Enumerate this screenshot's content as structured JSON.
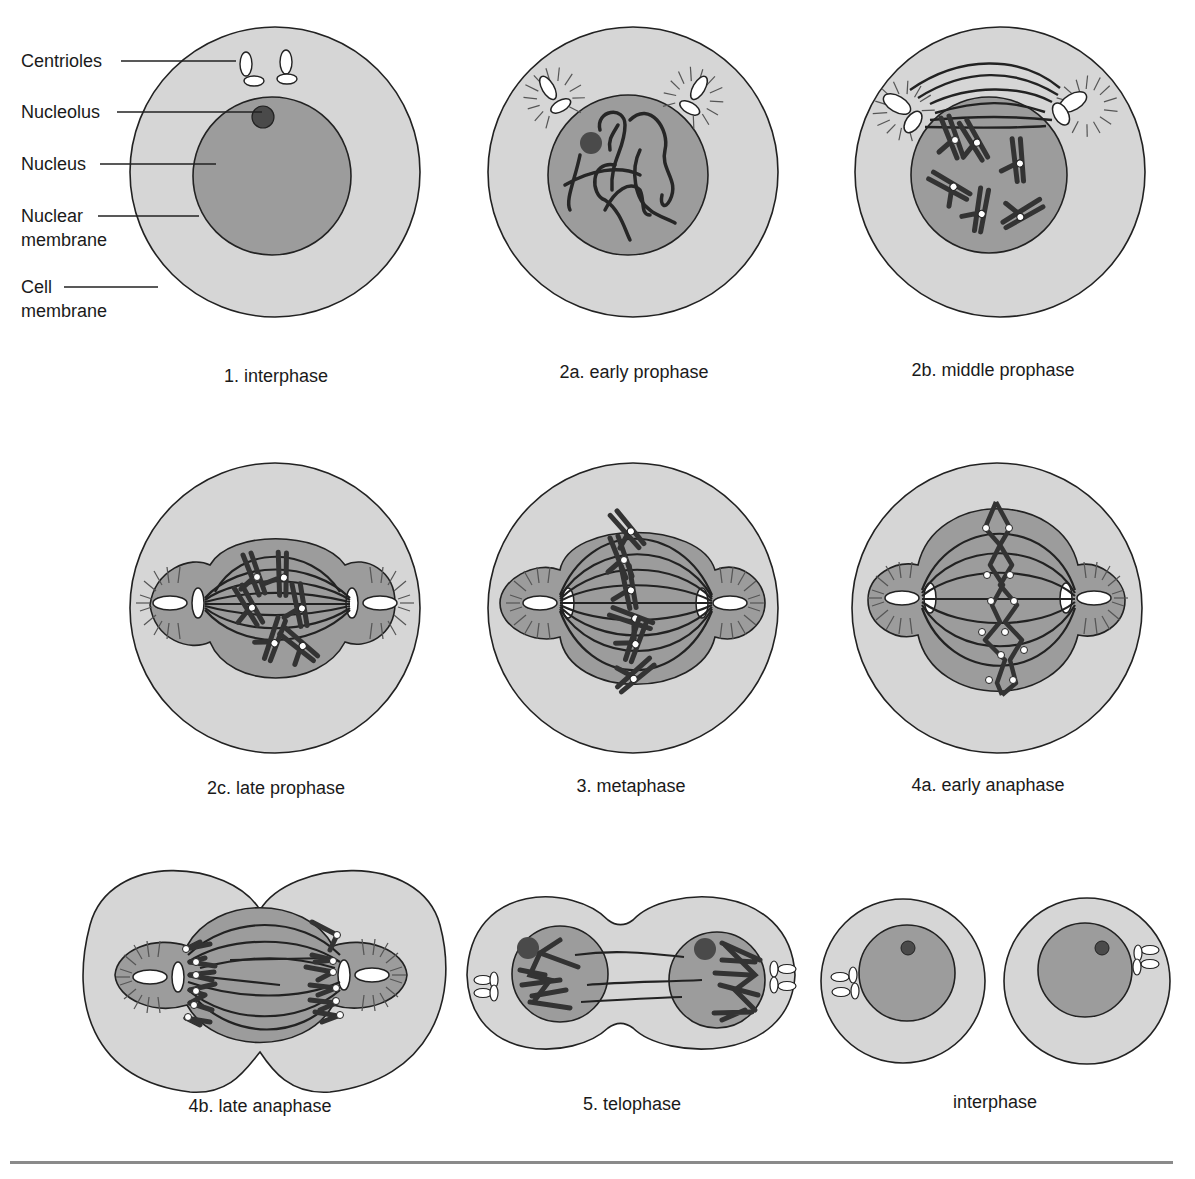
{
  "colors": {
    "cytoplasm": "#d6d6d6",
    "nucleus": "#9c9c9c",
    "nucleolus": "#4a4a4a",
    "chromosome": "#333333",
    "outline": "#222222",
    "centriole": "#ffffff",
    "rule": "#8a8a8a"
  },
  "annotations": [
    {
      "text": "Centrioles"
    },
    {
      "text": "Nucleolus"
    },
    {
      "text": "Nucleus"
    },
    {
      "text": "Nuclear"
    },
    {
      "text": "membrane"
    },
    {
      "text": "Cell"
    },
    {
      "text": "membrane"
    }
  ],
  "stages": [
    {
      "id": "1",
      "caption": "1. interphase"
    },
    {
      "id": "2a",
      "caption": "2a. early prophase"
    },
    {
      "id": "2b",
      "caption": "2b. middle prophase"
    },
    {
      "id": "2c",
      "caption": "2c. late prophase"
    },
    {
      "id": "3",
      "caption": "3. metaphase"
    },
    {
      "id": "4a",
      "caption": "4a. early anaphase"
    },
    {
      "id": "4b",
      "caption": "4b. late anaphase"
    },
    {
      "id": "5",
      "caption": "5. telophase"
    },
    {
      "id": "6",
      "caption": "interphase"
    }
  ]
}
